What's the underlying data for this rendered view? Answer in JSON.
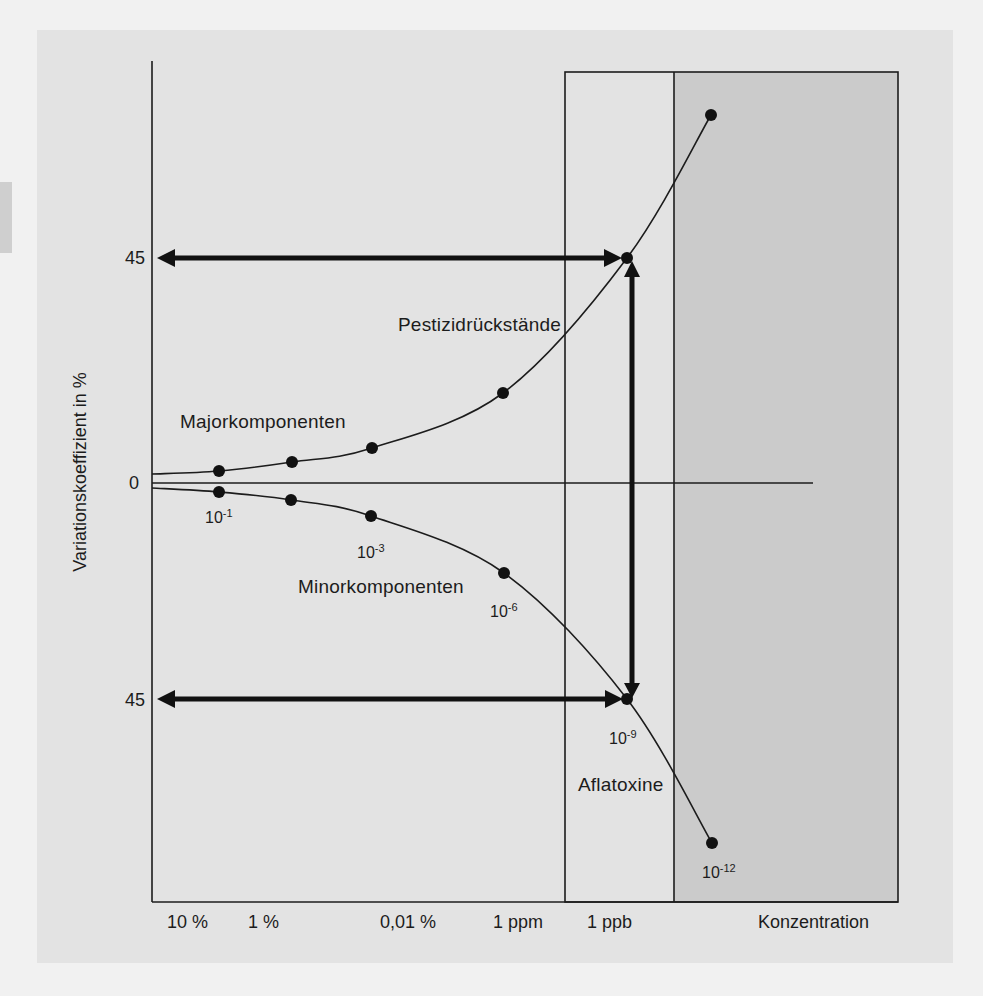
{
  "colors": {
    "page_background": "#f1f1f1",
    "figure_background": "#e3e3e3",
    "shaded_region": "#cbcbcb",
    "ink": "#1c1c1c"
  },
  "figure": {
    "y_axis": {
      "label": "Variationskoeffizient in %",
      "ticks": {
        "upper": "45",
        "zero": "0",
        "lower": "45"
      }
    },
    "x_axis": {
      "tick_labels": [
        "10 %",
        "1 %",
        "0,01 %",
        "1 ppm",
        "1 ppb"
      ],
      "title": "Konzentration"
    },
    "annotations": {
      "major": "Majorkomponenten",
      "pesticide": "Pestizidrückstände",
      "minor": "Minorkomponenten",
      "aflatoxin": "Aflatoxine"
    },
    "point_labels": [
      {
        "base": "10",
        "exp": "-1"
      },
      {
        "base": "10",
        "exp": "-3"
      },
      {
        "base": "10",
        "exp": "-6"
      },
      {
        "base": "10",
        "exp": "-9"
      },
      {
        "base": "10",
        "exp": "-12"
      }
    ]
  },
  "render": {
    "upper_curve": [
      [
        152,
        474
      ],
      [
        219,
        471
      ],
      [
        292,
        462
      ],
      [
        372,
        448
      ],
      [
        503,
        393
      ],
      [
        627,
        258
      ],
      [
        711,
        115
      ]
    ],
    "lower_curve": [
      [
        152,
        488
      ],
      [
        219,
        492
      ],
      [
        291,
        500
      ],
      [
        371,
        516
      ],
      [
        504,
        573
      ],
      [
        627,
        699
      ],
      [
        712,
        843
      ]
    ]
  },
  "chart_data": {
    "type": "line",
    "title": "",
    "xlabel": "Konzentration",
    "ylabel": "Variationskoeffizient in %",
    "x_tick_labels": [
      "10 %",
      "1 %",
      "0,01 %",
      "1 ppm",
      "1 ppb"
    ],
    "y_tick_labels": [
      "45",
      "0",
      "45"
    ],
    "x": [
      "10^-1",
      "10^-2",
      "10^-3",
      "10^-6",
      "10^-9",
      "10^-12"
    ],
    "series": [
      {
        "name": "Variationskoeffizient (+)",
        "values": [
          2.5,
          4.2,
          7,
          18,
          45,
          73
        ]
      },
      {
        "name": "Variationskoeffizient (-)",
        "values": [
          -2,
          -3.5,
          -6.6,
          -18,
          -45,
          -72
        ]
      }
    ],
    "annotations": [
      {
        "text": "Majorkomponenten",
        "near": "10^-1 .. 10^-3 (upper branch)"
      },
      {
        "text": "Pestizidrückstände",
        "near": "10^-6 .. 10^-9 (upper branch)"
      },
      {
        "text": "Minorkomponenten",
        "near": "10^-3 .. 10^-6 (lower branch)"
      },
      {
        "text": "Aflatoxine",
        "near": "10^-9 .. 10^-12 (lower branch)"
      },
      {
        "text": "double arrows marking CV = 45 % at 10^-9 (1 ppb)"
      }
    ],
    "regions": [
      {
        "type": "box",
        "from": "1 ppb",
        "to": "right edge",
        "shading": "left part unshaded, right part shaded gray"
      }
    ],
    "grid": false,
    "legend": "none"
  }
}
